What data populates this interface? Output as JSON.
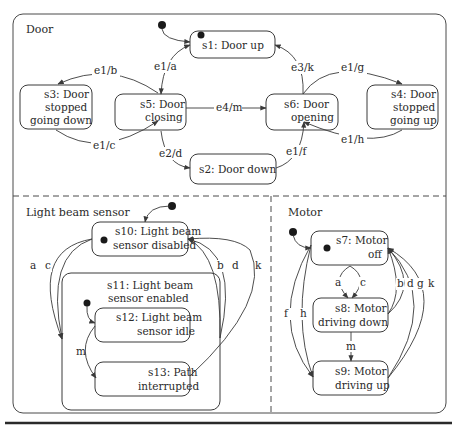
{
  "regions": {
    "door": {
      "title": "Door"
    },
    "light_beam_sensor": {
      "title": "Light beam sensor"
    },
    "motor": {
      "title": "Motor"
    }
  },
  "states": {
    "s1": {
      "lines": [
        "s1: Door up"
      ]
    },
    "s2": {
      "lines": [
        "s2: Door down"
      ]
    },
    "s3": {
      "lines": [
        "s3: Door",
        "stopped",
        "going down"
      ]
    },
    "s4": {
      "lines": [
        "s4: Door",
        "stopped",
        "going up"
      ]
    },
    "s5": {
      "lines": [
        "s5: Door",
        "closing"
      ]
    },
    "s6": {
      "lines": [
        "s6: Door",
        "opening"
      ]
    },
    "s7": {
      "lines": [
        "s7: Motor",
        "off"
      ]
    },
    "s8": {
      "lines": [
        "s8: Motor",
        "driving down"
      ]
    },
    "s9": {
      "lines": [
        "s9: Motor",
        "driving up"
      ]
    },
    "s10": {
      "lines": [
        "s10: Light beam",
        "sensor disabled"
      ]
    },
    "s11": {
      "lines": [
        "s11: Light beam",
        "sensor enabled"
      ]
    },
    "s12": {
      "lines": [
        "s12: Light beam",
        "sensor idle"
      ]
    },
    "s13": {
      "lines": [
        "s13: Path",
        "interrupted"
      ]
    }
  },
  "transitions": {
    "door": {
      "s1_s5": "e1/a",
      "s5_s3": "e1/b",
      "s3_s5": "e1/c",
      "s5_s2": "e2/d",
      "s5_s6": "e4/m",
      "s2_s6": "e1/f",
      "s6_s1": "e3/k",
      "s6_s4": "e1/g",
      "s4_s6": "e1/h"
    },
    "light_beam_sensor": {
      "a": "a",
      "c": "c",
      "b": "b",
      "d": "d",
      "k": "k",
      "m": "m"
    },
    "motor": {
      "a": "a",
      "c": "c",
      "b": "b",
      "d": "d",
      "g": "g",
      "k": "k",
      "f": "f",
      "h": "h",
      "m": "m"
    }
  },
  "colors": {
    "stroke": "#3a3a3a",
    "text": "#2a2a2a",
    "background": "#ffffff"
  }
}
